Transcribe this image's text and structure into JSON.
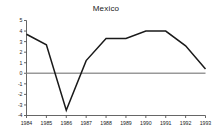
{
  "chart_data": {
    "type": "line",
    "title": "Mexico",
    "xlabel": "",
    "ylabel": "",
    "x": [
      1984,
      1985,
      1986,
      1987,
      1988,
      1989,
      1990,
      1991,
      1992,
      1993
    ],
    "categories": [
      "1984",
      "1985",
      "1986",
      "1987",
      "1988",
      "1989",
      "1990",
      "1991",
      "1992",
      "1993"
    ],
    "values": [
      3.7,
      2.7,
      -3.5,
      1.2,
      3.3,
      3.3,
      4.0,
      4.0,
      2.6,
      0.4
    ],
    "series": [
      {
        "name": "Mexico",
        "values": [
          3.7,
          2.7,
          -3.5,
          1.2,
          3.3,
          3.3,
          4.0,
          4.0,
          2.6,
          0.4
        ],
        "color": "#1a1a1a"
      }
    ],
    "ylim": [
      -4,
      5
    ],
    "xlim": [
      1984,
      1993
    ],
    "yticks": [
      5,
      4,
      3,
      2,
      1,
      0,
      -1,
      -2,
      -3,
      -4
    ],
    "ytick_labels": [
      "5",
      "4",
      "3",
      "2",
      "1",
      "0",
      "-1",
      "-2",
      "-3",
      "-4"
    ],
    "xticks": [
      1984,
      1985,
      1986,
      1987,
      1988,
      1989,
      1990,
      1991,
      1992,
      1993
    ],
    "xtick_labels": [
      "1984",
      "1985",
      "1986",
      "1987",
      "1988",
      "1989",
      "1990",
      "1991",
      "1992",
      "1993"
    ],
    "grid": false,
    "legend": null,
    "zero_line": {
      "value": 0,
      "color": "#999999",
      "visible": true
    },
    "axis_color": "#555555",
    "line_color": "#1a1a1a",
    "background_color": "#ffffff"
  }
}
